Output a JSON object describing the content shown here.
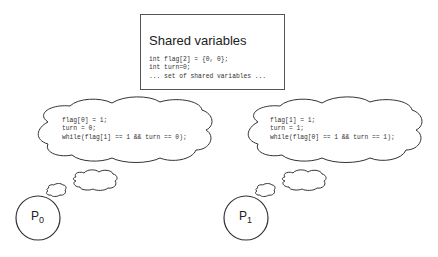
{
  "shared": {
    "title": "Shared variables",
    "lines": [
      "int flag[2] = {0, 0};",
      "int turn=0;",
      "... set of shared variables ..."
    ]
  },
  "processes": [
    {
      "name": "P",
      "index": "0",
      "code": [
        "flag[0] = 1;",
        "turn = 0;",
        "while(flag[1] == 1 && turn == 0);"
      ]
    },
    {
      "name": "P",
      "index": "1",
      "code": [
        "flag[1] = 1;",
        "turn = 1;",
        "while(flag[0] == 1 && turn == 1);"
      ]
    }
  ],
  "colors": {
    "stroke": "#333333",
    "text": "#222222",
    "background": "#ffffff"
  }
}
